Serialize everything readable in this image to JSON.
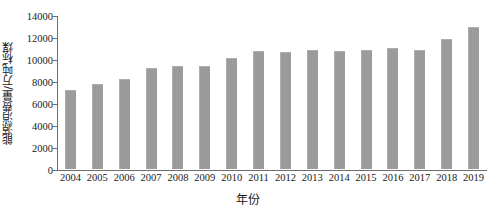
{
  "chart_data": {
    "type": "bar",
    "title": "",
    "xlabel": "年份",
    "ylabel": "能源消费量/万吨标煤",
    "categories": [
      "2004",
      "2005",
      "2006",
      "2007",
      "2008",
      "2009",
      "2010",
      "2011",
      "2012",
      "2013",
      "2014",
      "2015",
      "2016",
      "2017",
      "2018",
      "2019"
    ],
    "values": [
      7200,
      7750,
      8200,
      9200,
      9400,
      9400,
      10100,
      10700,
      10600,
      10800,
      10700,
      10800,
      11000,
      10800,
      11800,
      12900
    ],
    "ylim": [
      0,
      14000
    ],
    "yticks": [
      0,
      2000,
      4000,
      6000,
      8000,
      10000,
      12000,
      14000
    ],
    "ytick_labels": [
      "0",
      "2000",
      "4000",
      "6000",
      "8000",
      "10000",
      "12000",
      "14000"
    ],
    "grid": false,
    "legend": null,
    "legend_position": "none",
    "bar_color": "#9b9b9b",
    "axis_color": "#6e6e6e"
  }
}
